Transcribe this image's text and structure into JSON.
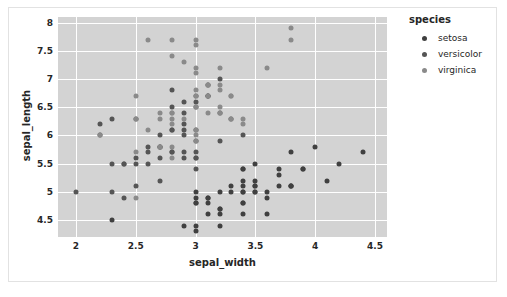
{
  "figure": {
    "background_color": "#ffffff",
    "border_color": "#e2e2e2",
    "plot_background_color": "#d3d3d3",
    "grid_color": "#ffffff"
  },
  "axes": {
    "xlabel": "sepal_width",
    "ylabel": "sepal_length",
    "xticks": [
      "2",
      "2.5",
      "3",
      "3.5",
      "4",
      "4.5"
    ],
    "yticks": [
      "4.5",
      "5",
      "5.5",
      "6",
      "6.5",
      "7",
      "7.5",
      "8"
    ]
  },
  "legend": {
    "title": "species",
    "entries": [
      {
        "label": "setosa",
        "color": "#404040"
      },
      {
        "label": "versicolor",
        "color": "#555555"
      },
      {
        "label": "virginica",
        "color": "#8a8a8a"
      }
    ]
  },
  "chart_data": {
    "type": "scatter",
    "title": "",
    "xlabel": "sepal_width",
    "ylabel": "sepal_length",
    "xlim": [
      1.85,
      4.6
    ],
    "ylim": [
      4.2,
      8.1
    ],
    "xticks": [
      2,
      2.5,
      3,
      3.5,
      4,
      4.5
    ],
    "yticks": [
      4.5,
      5,
      5.5,
      6,
      6.5,
      7,
      7.5,
      8
    ],
    "grid": true,
    "legend_position": "right",
    "legend_title": "species",
    "marker_size_px": 5,
    "series": [
      {
        "name": "setosa",
        "color": "#404040",
        "x": [
          3.5,
          3.0,
          3.2,
          3.1,
          3.6,
          3.9,
          3.4,
          3.4,
          2.9,
          3.1,
          3.7,
          3.4,
          3.0,
          3.0,
          4.0,
          4.4,
          3.9,
          3.5,
          3.8,
          3.8,
          3.4,
          3.7,
          3.6,
          3.3,
          3.4,
          3.0,
          3.4,
          3.5,
          3.4,
          3.2,
          3.1,
          3.4,
          4.1,
          4.2,
          3.1,
          3.2,
          3.5,
          3.6,
          3.0,
          3.4,
          3.5,
          2.3,
          3.2,
          3.5,
          3.8,
          3.0,
          3.8,
          3.2,
          3.7,
          3.3
        ],
        "y": [
          5.1,
          4.9,
          4.7,
          4.6,
          5.0,
          5.4,
          4.6,
          5.0,
          4.4,
          4.9,
          5.4,
          4.8,
          4.8,
          4.3,
          5.8,
          5.7,
          5.4,
          5.1,
          5.7,
          5.1,
          5.4,
          5.1,
          4.6,
          5.1,
          4.8,
          5.0,
          5.0,
          5.2,
          5.2,
          4.7,
          4.8,
          5.4,
          5.2,
          5.5,
          4.9,
          5.0,
          5.5,
          4.9,
          4.4,
          5.1,
          5.0,
          4.5,
          4.4,
          5.0,
          5.1,
          4.8,
          5.1,
          4.6,
          5.3,
          5.0
        ]
      },
      {
        "name": "versicolor",
        "color": "#555555",
        "x": [
          3.2,
          3.2,
          3.1,
          2.3,
          2.8,
          2.8,
          3.3,
          2.4,
          2.9,
          2.7,
          2.0,
          3.0,
          2.2,
          2.9,
          2.9,
          3.1,
          3.0,
          2.7,
          2.2,
          2.5,
          3.2,
          2.8,
          2.5,
          2.8,
          2.9,
          3.0,
          2.8,
          3.0,
          2.9,
          2.6,
          2.4,
          2.4,
          2.7,
          2.7,
          3.0,
          3.4,
          3.1,
          2.3,
          3.0,
          2.5,
          2.6,
          3.0,
          2.6,
          2.3,
          2.7,
          3.0,
          2.9,
          2.9,
          2.5,
          2.8
        ],
        "y": [
          7.0,
          6.4,
          6.9,
          5.5,
          6.5,
          5.7,
          6.3,
          4.9,
          6.6,
          5.2,
          5.0,
          5.9,
          6.0,
          6.1,
          5.6,
          6.7,
          5.6,
          5.8,
          6.2,
          5.6,
          5.9,
          6.1,
          6.3,
          6.1,
          6.4,
          6.6,
          6.8,
          6.7,
          6.0,
          5.7,
          5.5,
          5.5,
          5.8,
          6.0,
          5.4,
          6.0,
          6.7,
          6.3,
          5.6,
          5.5,
          5.5,
          6.1,
          5.8,
          5.0,
          5.6,
          5.7,
          5.7,
          6.2,
          5.1,
          5.7
        ]
      },
      {
        "name": "virginica",
        "color": "#8a8a8a",
        "x": [
          3.3,
          2.7,
          3.0,
          2.9,
          3.0,
          3.0,
          2.5,
          2.9,
          2.5,
          3.6,
          3.2,
          2.7,
          3.0,
          2.5,
          2.8,
          3.2,
          3.0,
          3.8,
          2.6,
          2.2,
          3.2,
          2.8,
          2.8,
          2.7,
          3.3,
          3.2,
          2.8,
          3.0,
          2.8,
          3.0,
          2.8,
          3.8,
          2.8,
          2.8,
          2.6,
          3.0,
          3.4,
          3.1,
          3.0,
          3.1,
          3.1,
          3.1,
          2.7,
          3.2,
          3.3,
          3.0,
          2.5,
          3.0,
          3.4,
          3.0
        ],
        "y": [
          6.3,
          5.8,
          7.1,
          6.3,
          6.5,
          7.6,
          4.9,
          7.3,
          6.7,
          7.2,
          6.5,
          6.4,
          6.8,
          5.7,
          5.8,
          6.4,
          6.5,
          7.7,
          7.7,
          6.0,
          6.9,
          5.6,
          7.7,
          6.3,
          6.7,
          7.2,
          6.2,
          6.1,
          6.4,
          7.2,
          7.4,
          7.9,
          6.4,
          6.3,
          6.1,
          7.7,
          6.3,
          6.4,
          6.0,
          6.9,
          6.7,
          6.9,
          5.8,
          6.8,
          6.7,
          6.7,
          6.3,
          6.5,
          6.2,
          5.9
        ]
      }
    ]
  }
}
